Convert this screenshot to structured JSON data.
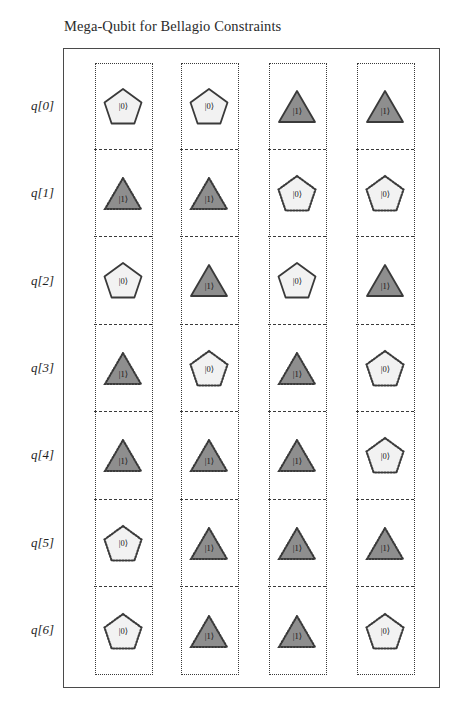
{
  "figure": {
    "title": "Mega-Qubit for Bellagio Constraints"
  },
  "legend_semantics": {
    "pentagon_state": "|0⟩",
    "triangle_state": "|1⟩",
    "pentagon_fill": "#f2f2f2",
    "triangle_fill": "#8e8e8e",
    "outline_color": "#3a3a3a",
    "frame_color": "#4a4a4a"
  },
  "rows": [
    {
      "label": "q[0]"
    },
    {
      "label": "q[1]"
    },
    {
      "label": "q[2]"
    },
    {
      "label": "q[3]"
    },
    {
      "label": "q[4]"
    },
    {
      "label": "q[5]"
    },
    {
      "label": "q[6]"
    }
  ],
  "columns": [
    {
      "name": "column-1"
    },
    {
      "name": "column-2"
    },
    {
      "name": "column-3"
    },
    {
      "name": "column-4"
    }
  ],
  "grid": [
    [
      {
        "shape": "pentagon",
        "state": "|0⟩",
        "outline": "solid"
      },
      {
        "shape": "pentagon",
        "state": "|0⟩",
        "outline": "solid"
      },
      {
        "shape": "triangle",
        "state": "|1⟩",
        "outline": "solid"
      },
      {
        "shape": "triangle",
        "state": "|1⟩",
        "outline": "solid"
      }
    ],
    [
      {
        "shape": "triangle",
        "state": "|1⟩",
        "outline": "dotted"
      },
      {
        "shape": "triangle",
        "state": "|1⟩",
        "outline": "dotted"
      },
      {
        "shape": "pentagon",
        "state": "|0⟩",
        "outline": "dotted"
      },
      {
        "shape": "pentagon",
        "state": "|0⟩",
        "outline": "dotted"
      }
    ],
    [
      {
        "shape": "pentagon",
        "state": "|0⟩",
        "outline": "solid"
      },
      {
        "shape": "triangle",
        "state": "|1⟩",
        "outline": "solid"
      },
      {
        "shape": "pentagon",
        "state": "|0⟩",
        "outline": "solid"
      },
      {
        "shape": "triangle",
        "state": "|1⟩",
        "outline": "solid"
      }
    ],
    [
      {
        "shape": "triangle",
        "state": "|1⟩",
        "outline": "dotted"
      },
      {
        "shape": "pentagon",
        "state": "|0⟩",
        "outline": "dotted"
      },
      {
        "shape": "triangle",
        "state": "|1⟩",
        "outline": "dotted"
      },
      {
        "shape": "pentagon",
        "state": "|0⟩",
        "outline": "dotted"
      }
    ],
    [
      {
        "shape": "triangle",
        "state": "|1⟩",
        "outline": "dotted"
      },
      {
        "shape": "triangle",
        "state": "|1⟩",
        "outline": "dotted"
      },
      {
        "shape": "triangle",
        "state": "|1⟩",
        "outline": "dotted"
      },
      {
        "shape": "pentagon",
        "state": "|0⟩",
        "outline": "dotted"
      }
    ],
    [
      {
        "shape": "pentagon",
        "state": "|0⟩",
        "outline": "dotted"
      },
      {
        "shape": "triangle",
        "state": "|1⟩",
        "outline": "dotted"
      },
      {
        "shape": "triangle",
        "state": "|1⟩",
        "outline": "dotted"
      },
      {
        "shape": "triangle",
        "state": "|1⟩",
        "outline": "dotted"
      }
    ],
    [
      {
        "shape": "pentagon",
        "state": "|0⟩",
        "outline": "dotted"
      },
      {
        "shape": "triangle",
        "state": "|1⟩",
        "outline": "dotted"
      },
      {
        "shape": "triangle",
        "state": "|1⟩",
        "outline": "dotted"
      },
      {
        "shape": "pentagon",
        "state": "|0⟩",
        "outline": "dotted"
      }
    ]
  ]
}
